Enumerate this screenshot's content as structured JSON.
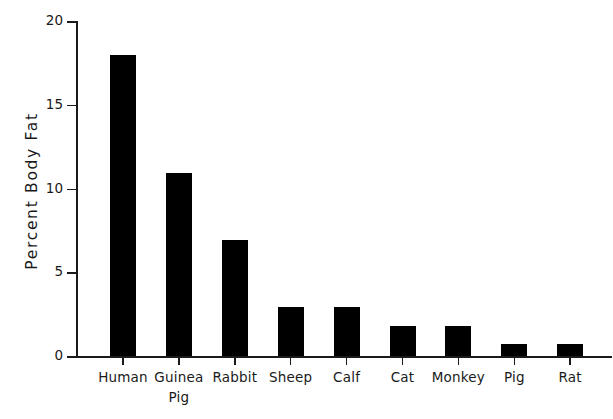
{
  "chart_data": {
    "type": "bar",
    "title": "",
    "xlabel": "",
    "ylabel": "Percent Body Fat",
    "categories": [
      "Human",
      "Guinea Pig",
      "Rabbit",
      "Sheep",
      "Calf",
      "Cat",
      "Monkey",
      "Pig",
      "Rat"
    ],
    "category_lines": [
      [
        "Human"
      ],
      [
        "Guinea",
        "Pig"
      ],
      [
        "Rabbit"
      ],
      [
        "Sheep"
      ],
      [
        "Calf"
      ],
      [
        "Cat"
      ],
      [
        "Monkey"
      ],
      [
        "Pig"
      ],
      [
        "Rat"
      ]
    ],
    "values": [
      18.0,
      10.9,
      6.9,
      2.9,
      2.9,
      1.8,
      1.8,
      0.7,
      0.7
    ],
    "ylim": [
      0,
      20
    ],
    "yticks": [
      0,
      5,
      10,
      15,
      20
    ],
    "ytick_labels": [
      "0",
      "5",
      "10",
      "15",
      "20"
    ],
    "grid": false,
    "legend": null,
    "bar_color": "#000000",
    "axis_color": "#1a1a1a",
    "background_color": "#ffffff"
  },
  "axis": {
    "y_title": "Percent Body Fat"
  }
}
